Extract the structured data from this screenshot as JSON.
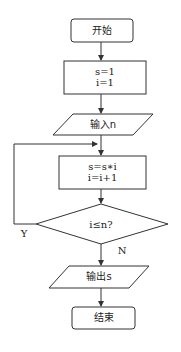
{
  "diagram": {
    "type": "flowchart",
    "line_color": "#333333",
    "background": "#ffffff",
    "nodes": [
      {
        "id": "start",
        "shape": "rounded-rect",
        "label": "开始"
      },
      {
        "id": "init",
        "shape": "rect",
        "lines": [
          "s=1",
          "i=1"
        ]
      },
      {
        "id": "input",
        "shape": "parallelogram",
        "label": "输入n"
      },
      {
        "id": "process",
        "shape": "rect",
        "lines": [
          "s=s∗i",
          "i=i+1"
        ]
      },
      {
        "id": "decision",
        "shape": "diamond",
        "label": "i≤n?"
      },
      {
        "id": "output",
        "shape": "parallelogram",
        "label": "输出s"
      },
      {
        "id": "end",
        "shape": "rounded-rect",
        "label": "结束"
      }
    ],
    "edges": [
      {
        "from": "start",
        "to": "init"
      },
      {
        "from": "init",
        "to": "input"
      },
      {
        "from": "input",
        "to": "process"
      },
      {
        "from": "process",
        "to": "decision"
      },
      {
        "from": "decision",
        "to": "process",
        "label": "Y"
      },
      {
        "from": "decision",
        "to": "output",
        "label": "N"
      },
      {
        "from": "output",
        "to": "end"
      }
    ],
    "edge_labels": {
      "yes": "Y",
      "no": "N"
    }
  }
}
